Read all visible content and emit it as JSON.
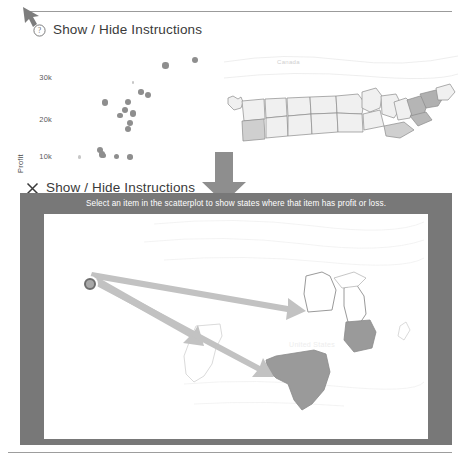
{
  "app": {
    "title": "Show / Hide Instructions"
  },
  "header_collapsed": {
    "icon": "question-circle-icon",
    "label": "Show / Hide Instructions"
  },
  "header_expanded": {
    "icon": "close-x-icon",
    "label": "Show / Hide Instructions"
  },
  "instruction_banner": {
    "text": "Select an item in the scatterplot to show states where that item has profit or loss.",
    "background": "#787878",
    "text_color": "#ffffff"
  },
  "top_map": {
    "country_label": "Canada",
    "label_color": "#cfcfcf"
  },
  "bottom_map": {
    "country_label": "United States",
    "highlighted_states": [
      "Texas",
      "Ohio"
    ],
    "outlined_states": [
      "Minnesota",
      "Michigan",
      "California"
    ],
    "fill_highlight": "#9a9a9a",
    "fill_plain": "#ffffff",
    "stroke": "#8d8d8d"
  },
  "annotations": {
    "cursor_icon": "cursor-arrow-icon",
    "transition_icon": "down-block-arrow-icon",
    "callout_arrows": 3,
    "arrow_color": "#b9b9b9",
    "source_marker": "selected-scatter-point"
  },
  "chart_data": {
    "type": "scatter",
    "title": "",
    "xlabel": "",
    "ylabel": "Profit",
    "yticks": [
      "10k",
      "20k",
      "30k"
    ],
    "ytick_values": [
      10000,
      20000,
      30000
    ],
    "ylim": [
      5000,
      38000
    ],
    "xlim": [
      0,
      100
    ],
    "grid": false,
    "legend": false,
    "marker_color": "#8e8e8e",
    "points": [
      {
        "x": 13,
        "y": 7800,
        "r": 1.6
      },
      {
        "x": 26,
        "y": 9900,
        "r": 3.0
      },
      {
        "x": 27,
        "y": 8600,
        "r": 3.4
      },
      {
        "x": 28,
        "y": 8300,
        "r": 2.6
      },
      {
        "x": 36,
        "y": 7900,
        "r": 2.6
      },
      {
        "x": 44,
        "y": 7900,
        "r": 2.8
      },
      {
        "x": 29,
        "y": 23200,
        "r": 3.2
      },
      {
        "x": 38,
        "y": 19500,
        "r": 2.8
      },
      {
        "x": 43,
        "y": 23300,
        "r": 3.2
      },
      {
        "x": 41,
        "y": 21200,
        "r": 3.0
      },
      {
        "x": 46,
        "y": 20100,
        "r": 3.4
      },
      {
        "x": 44,
        "y": 17400,
        "r": 3.2
      },
      {
        "x": 43,
        "y": 15800,
        "r": 3.0
      },
      {
        "x": 55,
        "y": 25400,
        "r": 3.0
      },
      {
        "x": 51,
        "y": 26100,
        "r": 2.8
      },
      {
        "x": 46,
        "y": 28800,
        "r": 1.2
      },
      {
        "x": 66,
        "y": 33600,
        "r": 3.2
      },
      {
        "x": 84,
        "y": 35200,
        "r": 3.2
      }
    ]
  }
}
